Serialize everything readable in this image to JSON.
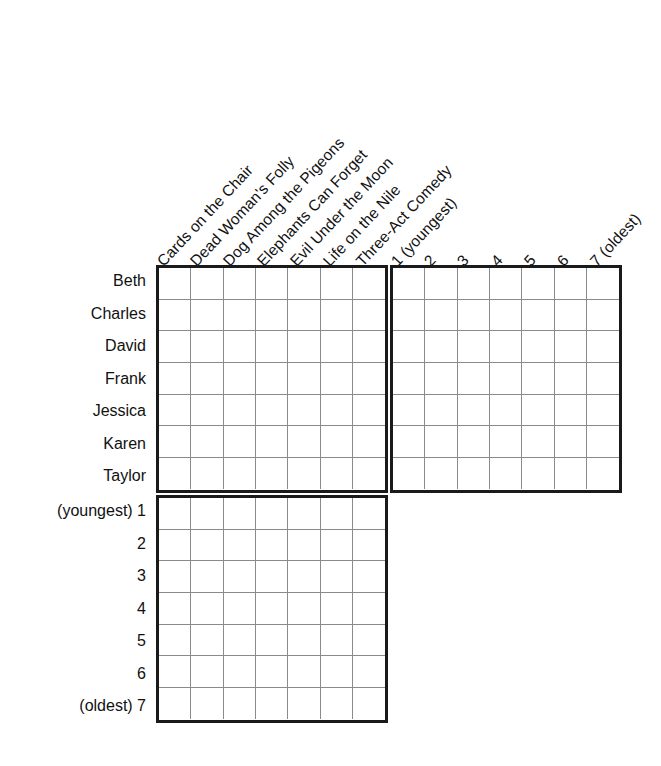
{
  "puzzle": {
    "type": "logic-grid",
    "title": "",
    "column_groups": [
      {
        "name": "books",
        "labels": [
          "Cards on the Chair",
          "Dead Woman's Folly",
          "Dog Among the Pigeons",
          "Elephants Can Forget",
          "Evil Under the Moon",
          "Life on the Nile",
          "Three-Act Comedy"
        ]
      },
      {
        "name": "ages",
        "labels": [
          "1 (youngest)",
          "2",
          "3",
          "4",
          "5",
          "6",
          "7 (oldest)"
        ]
      }
    ],
    "row_groups": [
      {
        "name": "people",
        "labels": [
          "Beth",
          "Charles",
          "David",
          "Frank",
          "Jessica",
          "Karen",
          "Taylor"
        ]
      },
      {
        "name": "ages",
        "labels": [
          "(youngest) 1",
          "2",
          "3",
          "4",
          "5",
          "6",
          "(oldest) 7"
        ]
      }
    ],
    "blocks": [
      {
        "name": "people-by-books",
        "rows": 7,
        "cols": 7
      },
      {
        "name": "people-by-ages",
        "rows": 7,
        "cols": 7
      },
      {
        "name": "ages-by-books",
        "rows": 7,
        "cols": 7
      }
    ],
    "colors": {
      "outer_border": "#1a1a1a",
      "inner_line": "#8a8a8a",
      "background": "#ffffff",
      "text": "#111111"
    },
    "geometry": {
      "cell_width": 33.2,
      "cell_height": 32.5,
      "left_block_x": 156,
      "right_block_x": 390,
      "top_block_y": 265,
      "bottom_block_y": 495
    }
  }
}
